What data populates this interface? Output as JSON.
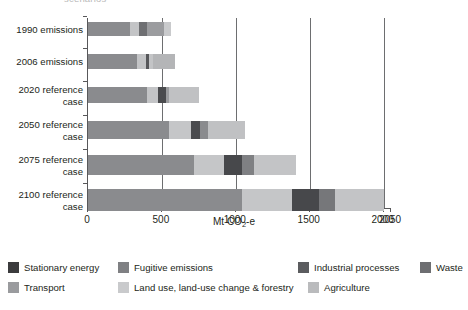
{
  "clipped_title": "scenarios",
  "axis": {
    "x_title_prefix": "Mt CO",
    "x_title_sub": "2",
    "x_title_suffix": "-e",
    "x_title_full": "Mt CO2-e",
    "ticks": [
      "0",
      "500",
      "1000",
      "1500",
      "2000",
      "2050"
    ],
    "tick_values": [
      0,
      500,
      1000,
      1500,
      2000,
      2050
    ],
    "xmin": 0,
    "xmax": 2050
  },
  "categories": [
    "1990 emissions",
    "2006 emissions",
    "2020 reference\ncase",
    "2050 reference\ncase",
    "2075 reference\ncase",
    "2100 reference\ncase"
  ],
  "legend": {
    "items": [
      {
        "label": "Stationary energy",
        "color": "#3b3b3d"
      },
      {
        "label": "Fugitive emissions",
        "color": "#7f8083"
      },
      {
        "label": "Industrial processes",
        "color": "#5b5c5f"
      },
      {
        "label": "Waste",
        "color": "#6d6e71"
      },
      {
        "label": "Transport",
        "color": "#9a9b9e"
      },
      {
        "label": "Land use, land-use change & forestry",
        "color": "#c9cacc"
      },
      {
        "label": "Agriculture",
        "color": "#babbbd"
      }
    ]
  },
  "chart_data": {
    "type": "bar",
    "orientation": "horizontal",
    "stacked": true,
    "title": "",
    "xlabel": "Mt CO2-e",
    "ylabel": "",
    "xlim": [
      0,
      2050
    ],
    "grid": true,
    "gridlines": [
      500,
      1000,
      1500,
      2000
    ],
    "legend_position": "bottom",
    "categories": [
      "1990 emissions",
      "2006 emissions",
      "2020 reference case",
      "2050 reference case",
      "2075 reference case",
      "2100 reference case"
    ],
    "series": [
      {
        "name": "Stationary energy",
        "color": "#3b3b3d",
        "values": [
          285,
          330,
          400,
          550,
          720,
          1040
        ]
      },
      {
        "name": "Transport",
        "color": "#9a9b9e",
        "values": [
          60,
          0,
          0,
          0,
          0,
          0
        ]
      },
      {
        "name": "Fugitive emissions",
        "color": "#7f8083",
        "values": [
          55,
          0,
          0,
          0,
          0,
          0
        ]
      },
      {
        "name": "Land use, land-use change & forestry",
        "color": "#c9cacc",
        "values": [
          115,
          60,
          75,
          150,
          200,
          340
        ]
      },
      {
        "name": "Industrial processes",
        "color": "#5b5c5f",
        "values": [
          0,
          25,
          50,
          60,
          120,
          180
        ]
      },
      {
        "name": "Waste",
        "color": "#6d6e71",
        "values": [
          0,
          25,
          25,
          50,
          80,
          110
        ]
      },
      {
        "name": "Agriculture",
        "color": "#babbbd",
        "values": [
          50,
          150,
          200,
          250,
          290,
          330
        ]
      }
    ],
    "totals": [
      565,
      590,
      750,
      1060,
      1410,
      2000
    ]
  },
  "bars": [
    {
      "category": "1990 emissions",
      "total": 565,
      "segments": [
        {
          "name": "Stationary energy",
          "value": 285,
          "color": "#8a8b8e"
        },
        {
          "name": "Transport",
          "value": 60,
          "color": "#c3c4c6"
        },
        {
          "name": "Fugitive emissions",
          "value": 55,
          "color": "#6e6f72"
        },
        {
          "name": "Land use, land-use change & forestry",
          "value": 115,
          "color": "#9b9c9f"
        },
        {
          "name": "Agriculture",
          "value": 50,
          "color": "#c9cacc"
        }
      ]
    },
    {
      "category": "2006 emissions",
      "total": 590,
      "segments": [
        {
          "name": "Stationary energy",
          "value": 330,
          "color": "#8a8b8e"
        },
        {
          "name": "Land use, land-use change & forestry",
          "value": 60,
          "color": "#c3c4c6"
        },
        {
          "name": "Industrial processes",
          "value": 25,
          "color": "#56575a"
        },
        {
          "name": "Waste",
          "value": 25,
          "color": "#c3c4c6"
        },
        {
          "name": "Agriculture",
          "value": 150,
          "color": "#b4b5b7"
        }
      ]
    },
    {
      "category": "2020 reference case",
      "total": 750,
      "segments": [
        {
          "name": "Stationary energy",
          "value": 400,
          "color": "#8a8b8e"
        },
        {
          "name": "Land use, land-use change & forestry",
          "value": 75,
          "color": "#c3c4c6"
        },
        {
          "name": "Industrial processes",
          "value": 50,
          "color": "#4a4b4e"
        },
        {
          "name": "Waste",
          "value": 25,
          "color": "#9b9c9f"
        },
        {
          "name": "Agriculture",
          "value": 200,
          "color": "#c0c1c3"
        }
      ]
    },
    {
      "category": "2050 reference case",
      "total": 1060,
      "segments": [
        {
          "name": "Stationary energy",
          "value": 550,
          "color": "#8a8b8e"
        },
        {
          "name": "Land use, land-use change & forestry",
          "value": 150,
          "color": "#c5c6c8"
        },
        {
          "name": "Industrial processes",
          "value": 60,
          "color": "#4a4b4e"
        },
        {
          "name": "Waste",
          "value": 50,
          "color": "#8a8b8e"
        },
        {
          "name": "Agriculture",
          "value": 250,
          "color": "#c0c1c3"
        }
      ]
    },
    {
      "category": "2075 reference case",
      "total": 1410,
      "segments": [
        {
          "name": "Stationary energy",
          "value": 720,
          "color": "#8a8b8e"
        },
        {
          "name": "Land use, land-use change & forestry",
          "value": 200,
          "color": "#c5c6c8"
        },
        {
          "name": "Industrial processes",
          "value": 120,
          "color": "#47484b"
        },
        {
          "name": "Waste",
          "value": 80,
          "color": "#7f8083"
        },
        {
          "name": "Agriculture",
          "value": 290,
          "color": "#c3c4c6"
        }
      ]
    },
    {
      "category": "2100 reference case",
      "total": 2000,
      "segments": [
        {
          "name": "Stationary energy",
          "value": 1040,
          "color": "#8a8b8e"
        },
        {
          "name": "Land use, land-use change & forestry",
          "value": 340,
          "color": "#c5c6c8"
        },
        {
          "name": "Industrial processes",
          "value": 180,
          "color": "#47484b"
        },
        {
          "name": "Waste",
          "value": 110,
          "color": "#76777a"
        },
        {
          "name": "Agriculture",
          "value": 330,
          "color": "#c3c4c6"
        }
      ]
    }
  ]
}
